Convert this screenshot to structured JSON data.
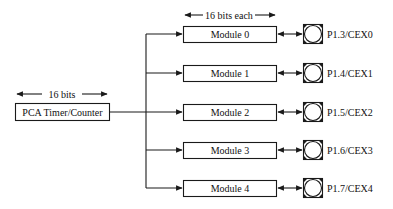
{
  "diagram": {
    "colors": {
      "line": "#1a1a1a",
      "background": "#ffffff",
      "text": "#111111"
    },
    "timer": {
      "label": "PCA Timer/Counter",
      "width_label": "16 bits"
    },
    "modules_width_label": "16 bits each",
    "modules": [
      {
        "label": "Module 0",
        "pin": "P1.3/CEX0"
      },
      {
        "label": "Module 1",
        "pin": "P1.4/CEX1"
      },
      {
        "label": "Module 2",
        "pin": "P1.5/CEX2"
      },
      {
        "label": "Module 3",
        "pin": "P1.6/CEX3"
      },
      {
        "label": "Module 4",
        "pin": "P1.7/CEX4"
      }
    ],
    "connections": [
      {
        "from": "PCA Timer/Counter",
        "to": "Module 0",
        "type": "one-way"
      },
      {
        "from": "PCA Timer/Counter",
        "to": "Module 1",
        "type": "one-way"
      },
      {
        "from": "PCA Timer/Counter",
        "to": "Module 2",
        "type": "one-way"
      },
      {
        "from": "PCA Timer/Counter",
        "to": "Module 3",
        "type": "one-way"
      },
      {
        "from": "PCA Timer/Counter",
        "to": "Module 4",
        "type": "one-way"
      },
      {
        "from": "Module 0",
        "to": "P1.3/CEX0",
        "type": "bidirectional"
      },
      {
        "from": "Module 1",
        "to": "P1.4/CEX1",
        "type": "bidirectional"
      },
      {
        "from": "Module 2",
        "to": "P1.5/CEX2",
        "type": "bidirectional"
      },
      {
        "from": "Module 3",
        "to": "P1.6/CEX3",
        "type": "bidirectional"
      },
      {
        "from": "Module 4",
        "to": "P1.7/CEX4",
        "type": "bidirectional"
      }
    ]
  }
}
